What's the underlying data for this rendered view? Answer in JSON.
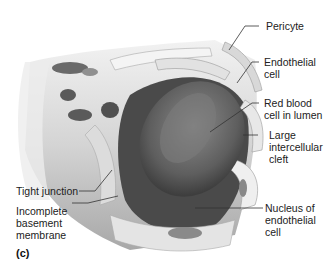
{
  "figure": {
    "panel_label": "(c)",
    "labels": [
      {
        "id": "pericyte",
        "text": "Pericyte"
      },
      {
        "id": "endothelial-cell",
        "text": "Endothelial\ncell"
      },
      {
        "id": "red-blood-cell",
        "text": "Red blood\ncell in lumen"
      },
      {
        "id": "intercellular-cleft",
        "text": "Large\nintercellular\ncleft"
      },
      {
        "id": "tight-junction",
        "text": "Tight junction"
      },
      {
        "id": "basement-membrane",
        "text": "Incomplete\nbasement\nmembrane"
      },
      {
        "id": "nucleus",
        "text": "Nucleus of\nendothelial\ncell"
      }
    ],
    "colors": {
      "background": "#ffffff",
      "tissue_light": "#e6e6e6",
      "tissue_mid": "#bdbdbd",
      "tissue_dark": "#5a5a5a",
      "rbc": "#6b6b6b",
      "leader": "#333333"
    }
  }
}
